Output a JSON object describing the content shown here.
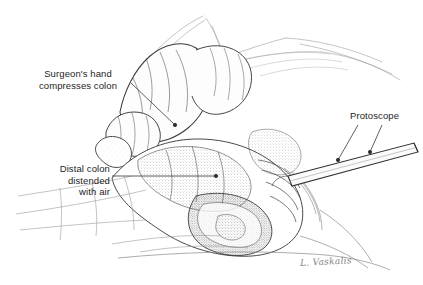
{
  "figure": {
    "type": "medical-illustration",
    "medium": "pen-and-ink line drawing with stipple shading",
    "background_color": "#ffffff",
    "ink_color": "#333333"
  },
  "labels": {
    "surgeon_hand": "Surgeon's hand\ncompresses colon",
    "distal_colon": "Distal colon\ndistended\nwith air",
    "proctoscope": "Protoscope"
  },
  "signature": {
    "text": "L. Vaskalis"
  },
  "leaders": [
    {
      "name": "surgeon-hand-leader",
      "from_label": "surgeon_hand",
      "target_dot": [
        175,
        125
      ]
    },
    {
      "name": "distal-colon-leader",
      "from_label": "distal_colon",
      "target_dot": [
        216,
        176
      ]
    },
    {
      "name": "proctoscope-leader-left",
      "from_label": "proctoscope",
      "target_dot": [
        338,
        160
      ]
    },
    {
      "name": "proctoscope-leader-right",
      "from_label": "proctoscope",
      "target_dot": [
        370,
        152
      ]
    }
  ]
}
